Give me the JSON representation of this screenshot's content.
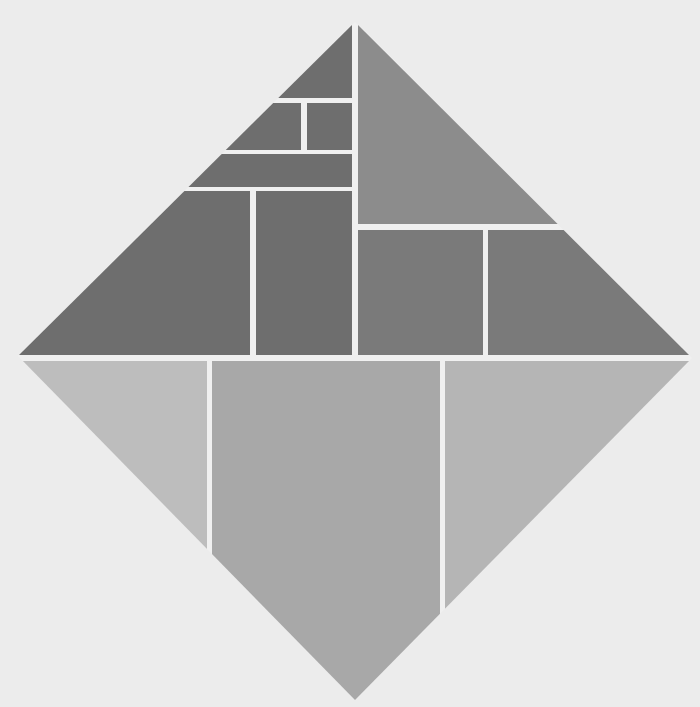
{
  "artwork": {
    "description": "Diamond divided into gray rectangular panels",
    "background": "#ececec",
    "gap_color": "#f0f0f0",
    "colors": {
      "dark": "#6e6e6e",
      "medium": "#8c8c8c",
      "light_mid": "#a8a8a8",
      "light": "#bdbdbd"
    }
  }
}
